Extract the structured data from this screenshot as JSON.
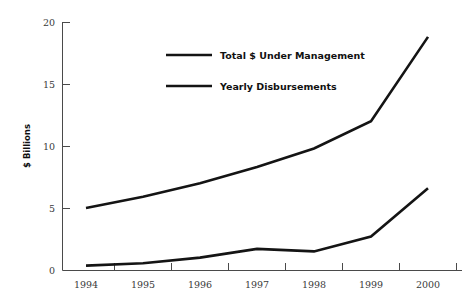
{
  "chart_data": {
    "type": "line",
    "title": "",
    "xlabel": "",
    "ylabel": "$ Billions",
    "categories": [
      "1994",
      "1995",
      "1996",
      "1997",
      "1998",
      "1999",
      "2000"
    ],
    "x": [
      1994,
      1995,
      1996,
      1997,
      1998,
      1999,
      2000
    ],
    "xlim": [
      1994,
      2000
    ],
    "ylim": [
      0,
      20
    ],
    "yticks": [
      0,
      5,
      10,
      15,
      20
    ],
    "ytick_labels": [
      "0",
      "5",
      "10",
      "15",
      "20"
    ],
    "grid": false,
    "legend_position": "upper-center-inside",
    "series": [
      {
        "name": "Total $ Under Management",
        "color": "#141414",
        "values": [
          5.0,
          5.9,
          7.0,
          8.3,
          9.8,
          12.0,
          18.8
        ]
      },
      {
        "name": "Yearly Disbursements",
        "color": "#141414",
        "values": [
          0.35,
          0.55,
          1.0,
          1.7,
          1.5,
          2.7,
          6.6
        ]
      }
    ]
  },
  "axes": {
    "y_axis_title": "$ Billions",
    "y_tick_0": "0",
    "y_tick_1": "5",
    "y_tick_2": "10",
    "y_tick_3": "15",
    "y_tick_4": "20",
    "x_tick_0": "1994",
    "x_tick_1": "1995",
    "x_tick_2": "1996",
    "x_tick_3": "1997",
    "x_tick_4": "1998",
    "x_tick_5": "1999",
    "x_tick_6": "2000"
  },
  "legend": {
    "entry_0_label": "Total $ Under Management",
    "entry_1_label": "Yearly Disbursements"
  }
}
